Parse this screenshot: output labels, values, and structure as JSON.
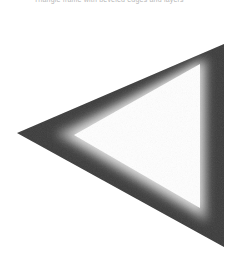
{
  "caption": {
    "text": "Triangle frame with beveled edges and layers"
  },
  "figure": {
    "shape": "triangle-frame",
    "orientation": "pointing-left",
    "colors": {
      "outer": "#3a3a3a",
      "inner_edge": "#f2f2f2",
      "fill": "#ffffff"
    }
  }
}
